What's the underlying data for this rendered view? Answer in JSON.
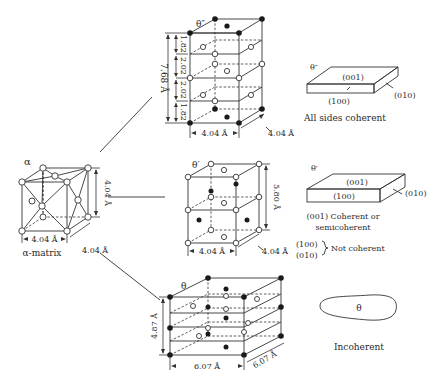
{
  "alpha_matrix": {
    "symbol": "α",
    "caption": "α-matrix",
    "width_label": "4.04 Å",
    "depth_label": "4.04 Å",
    "height_label": "4.04 Å"
  },
  "theta_double_prime": {
    "symbol": "θ″",
    "height_total": "7.68 Å",
    "segments": [
      "1.82",
      "2.02",
      "2.02",
      "1.82"
    ],
    "width_label": "4.04 Å",
    "depth_label": "4.04 Å",
    "plate": {
      "symbol": "θ″",
      "top_face": "(001)",
      "front_face": "(100)",
      "side_face": "(010)",
      "caption": "All sides coherent"
    }
  },
  "theta_prime": {
    "symbol": "θ′",
    "height_label": "5.80 Å",
    "width_label": "4.04 Å",
    "depth_label": "4.04 Å",
    "plate": {
      "symbol": "θ′",
      "top_face": "(001)",
      "front_face": "(100)",
      "side_face": "(010)",
      "caption_line1": "(001) Coherent or",
      "caption_line2": "semicoherent",
      "note_faces": [
        "(100)",
        "(010)"
      ],
      "note_text": "Not coherent"
    }
  },
  "theta": {
    "symbol": "θ",
    "height_label": "4.87 Å",
    "width_label": "6.07 Å",
    "depth_label": "6.07 Å",
    "particle": {
      "symbol": "θ",
      "caption": "Incoherent"
    }
  }
}
